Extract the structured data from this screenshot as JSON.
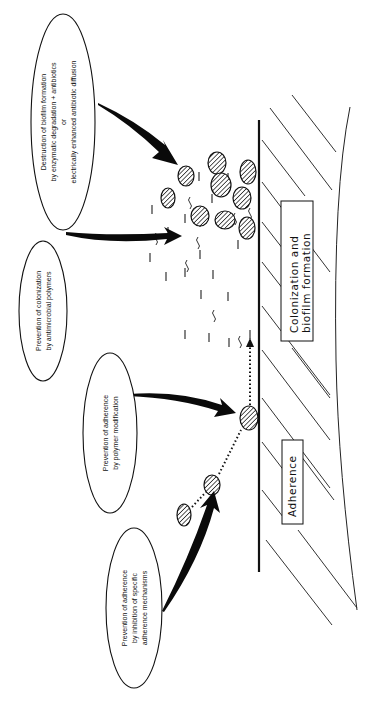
{
  "diagram": {
    "ovals": [
      {
        "id": "destruction",
        "lines": [
          "Destruction of biofilm formation",
          "by enzymatic degradation + antibiotics",
          "or",
          "electrically enhanced antibiotic diffusion"
        ]
      },
      {
        "id": "colonization",
        "lines": [
          "Prevention of colonization",
          "by antimicrobial polymers"
        ]
      },
      {
        "id": "polymer-mod",
        "lines": [
          "Prevention of adherence",
          "by polymer modification"
        ]
      },
      {
        "id": "specific-mech",
        "lines": [
          "Prevention of adherence",
          "by inhibition of specific",
          "adherence mechanisms"
        ]
      }
    ],
    "boxes": {
      "adherence": "Adherence",
      "colonization": [
        "Colonization  and",
        "biofilm formation"
      ]
    },
    "colors": {
      "ink": "#111111",
      "background": "#ffffff"
    }
  }
}
